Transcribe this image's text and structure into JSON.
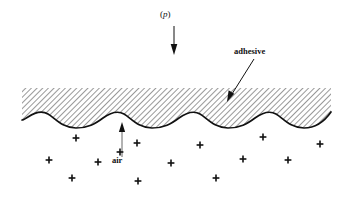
{
  "figure": {
    "type": "diagram",
    "background_color": "#ffffff",
    "line_color": "#111111",
    "hatch_color": "#333333"
  },
  "labels": {
    "pressure_prefix": "(",
    "pressure_symbol": "p",
    "pressure_suffix": ")",
    "adhesive": "adhesive",
    "air": "air"
  },
  "annotations": {
    "pressure_arrow": {
      "name": "pressure-arrow",
      "direction": "down",
      "x": 174,
      "y_start": 26,
      "y_end": 54
    },
    "adhesive_leader": {
      "name": "adhesive-leader-arrow",
      "direction": "down-left",
      "x_start": 254,
      "y_start": 59,
      "x_end": 228,
      "y_end": 101
    },
    "air_arrow": {
      "name": "air-arrow",
      "direction": "up",
      "x": 122,
      "y_start": 157,
      "y_end": 123
    }
  },
  "adhesive_layer": {
    "x_left": 22,
    "x_right": 331,
    "top_y": 88,
    "hatch_angle_deg": 45,
    "hatch_spacing_px": 4
  },
  "wavy_interface": {
    "description": "sinusoidal adhesive/substrate boundary with four crests",
    "crest_y": 114,
    "trough_y": 127,
    "wavelength_px": 55
  },
  "air_markers": {
    "glyph": "+",
    "count": 14,
    "positions": [
      {
        "x": 76,
        "y": 138
      },
      {
        "x": 137,
        "y": 143
      },
      {
        "x": 200,
        "y": 145
      },
      {
        "x": 263,
        "y": 137
      },
      {
        "x": 120,
        "y": 152
      },
      {
        "x": 49,
        "y": 160
      },
      {
        "x": 98,
        "y": 162
      },
      {
        "x": 171,
        "y": 163
      },
      {
        "x": 243,
        "y": 159
      },
      {
        "x": 288,
        "y": 160
      },
      {
        "x": 320,
        "y": 144
      },
      {
        "x": 72,
        "y": 178
      },
      {
        "x": 138,
        "y": 181
      },
      {
        "x": 216,
        "y": 178
      }
    ]
  }
}
